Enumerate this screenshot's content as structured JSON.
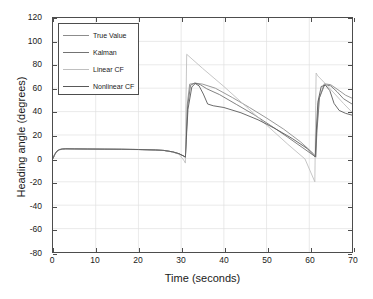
{
  "chart_data": {
    "type": "line",
    "title": "",
    "xlabel": "Time (seconds)",
    "ylabel": "Heading angle (degrees)",
    "xlim": [
      0,
      70
    ],
    "ylim": [
      -80,
      120
    ],
    "xticks": [
      0,
      10,
      20,
      30,
      40,
      50,
      60,
      70
    ],
    "yticks": [
      -80,
      -60,
      -40,
      -20,
      0,
      20,
      40,
      60,
      80,
      100,
      120
    ],
    "grid": true,
    "legend_position": "upper-left",
    "series": [
      {
        "name": "True Value",
        "color": "#8c8c8c",
        "x": [
          0,
          0.4,
          0.9,
          1.5,
          2.2,
          3.0,
          5.0,
          8.0,
          12.0,
          16.0,
          20.0,
          24.0,
          26.0,
          28.0,
          29.5,
          30.6,
          31.0,
          31.2,
          31.4,
          32.0,
          33.5,
          35.0,
          38.0,
          42.0,
          46.0,
          50.0,
          54.0,
          58.0,
          61.0,
          61.3,
          61.5,
          61.7,
          62.2,
          63.5,
          65.0,
          67.0,
          68.5,
          70.0
        ],
        "y": [
          0,
          3.5,
          6.2,
          7.6,
          8.1,
          8.2,
          8.1,
          8.0,
          7.9,
          7.8,
          7.6,
          7.2,
          6.8,
          5.6,
          4.0,
          2.0,
          1.2,
          20.0,
          45.0,
          63.5,
          64.2,
          63.5,
          60.0,
          52.0,
          43.5,
          34.5,
          25.0,
          14.0,
          4.0,
          2.5,
          1.5,
          22.0,
          50.0,
          63.8,
          63.0,
          58.0,
          54.0,
          51.5
        ]
      },
      {
        "name": "Kalman",
        "color": "#737373",
        "x": [
          0,
          0.4,
          0.9,
          1.5,
          2.2,
          3.0,
          5.0,
          8.0,
          12.0,
          16.0,
          20.0,
          24.0,
          26.0,
          28.0,
          29.5,
          30.6,
          31.0,
          31.2,
          31.5,
          32.2,
          33.2,
          34.5,
          36.0,
          39.0,
          43.0,
          47.0,
          51.0,
          55.0,
          58.5,
          61.0,
          61.3,
          61.5,
          61.8,
          62.4,
          63.6,
          65.0,
          66.5,
          68.0,
          70.0
        ],
        "y": [
          0,
          3.2,
          6.0,
          7.4,
          8.0,
          8.2,
          8.1,
          8.0,
          7.9,
          7.8,
          7.6,
          7.2,
          6.8,
          5.6,
          4.0,
          2.0,
          1.0,
          18.0,
          44.0,
          62.5,
          64.5,
          63.0,
          59.5,
          54.5,
          46.0,
          37.5,
          28.0,
          18.0,
          9.0,
          2.5,
          1.8,
          1.0,
          24.0,
          52.0,
          63.0,
          62.0,
          57.0,
          51.0,
          46.5
        ]
      },
      {
        "name": "Linear CF",
        "color": "#bfbfbf",
        "x": [
          0,
          0.4,
          0.9,
          1.5,
          2.2,
          3.0,
          5.0,
          8.0,
          12.0,
          16.0,
          20.0,
          24.0,
          26.0,
          28.0,
          29.5,
          30.6,
          31.0,
          31.1,
          31.3,
          35.0,
          40.0,
          45.0,
          50.0,
          55.0,
          59.0,
          61.3,
          61.4,
          61.5,
          61.6,
          62.0,
          64.0,
          66.0,
          68.0,
          70.0
        ],
        "y": [
          0,
          3.0,
          5.8,
          7.2,
          7.9,
          8.1,
          8.0,
          7.9,
          7.8,
          7.7,
          7.5,
          7.1,
          6.7,
          5.4,
          3.6,
          -1.5,
          -4.0,
          40.0,
          89.0,
          77.0,
          61.5,
          45.0,
          28.5,
          12.0,
          -0.5,
          -20.0,
          10.0,
          45.0,
          73.0,
          70.5,
          63.0,
          55.0,
          47.0,
          39.5
        ]
      },
      {
        "name": "Nonlinear CF",
        "color": "#595959",
        "x": [
          0,
          0.4,
          0.9,
          1.5,
          2.2,
          3.0,
          5.0,
          8.0,
          12.0,
          16.0,
          20.0,
          24.0,
          26.0,
          28.0,
          29.5,
          30.6,
          31.0,
          31.2,
          31.6,
          32.5,
          33.3,
          34.2,
          35.2,
          36.2,
          37.5,
          40.0,
          44.0,
          48.0,
          52.0,
          56.0,
          59.5,
          61.2,
          61.4,
          61.6,
          62.0,
          62.8,
          63.8,
          64.8,
          65.8,
          67.0,
          68.5,
          70.0
        ],
        "y": [
          0,
          3.4,
          6.1,
          7.5,
          8.0,
          8.2,
          8.1,
          8.0,
          7.9,
          7.8,
          7.6,
          7.2,
          6.8,
          5.6,
          4.0,
          2.0,
          1.0,
          16.0,
          42.0,
          61.0,
          64.0,
          62.0,
          55.0,
          46.5,
          45.0,
          43.5,
          39.0,
          33.0,
          25.5,
          17.0,
          8.5,
          2.0,
          1.2,
          20.0,
          48.0,
          61.5,
          62.5,
          58.0,
          47.0,
          41.0,
          38.5,
          37.0
        ]
      }
    ]
  },
  "legend": {
    "entries": [
      {
        "label": "True Value"
      },
      {
        "label": "Kalman"
      },
      {
        "label": "Linear CF"
      },
      {
        "label": "Nonlinear CF"
      }
    ]
  },
  "axes": {
    "x_title": "Time (seconds)",
    "y_title": "Heading angle (degrees)",
    "x_tick_labels": [
      "0",
      "10",
      "20",
      "30",
      "40",
      "50",
      "60",
      "70"
    ],
    "y_tick_labels": [
      "120",
      "100",
      "80",
      "60",
      "40",
      "20",
      "0",
      "-20",
      "-40",
      "-60",
      "-80"
    ]
  },
  "style": {
    "axis_color": "#4d4d4d",
    "grid_color": "#e0e0e0",
    "background": "#ffffff",
    "text_color": "#1a1a1a"
  }
}
